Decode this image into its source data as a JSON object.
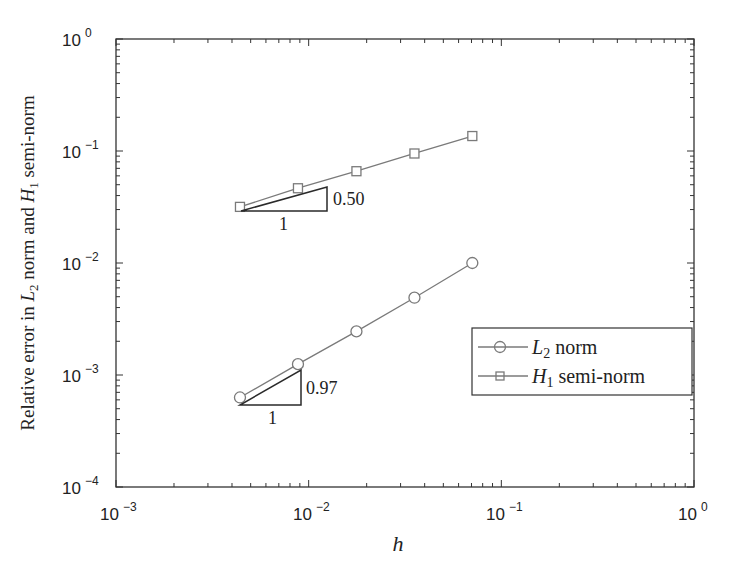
{
  "chart_data": {
    "type": "line",
    "title": "",
    "xlabel": "h",
    "ylabel": "Relative error in L2 norm and H1 semi-norm",
    "xscale": "log",
    "yscale": "log",
    "xlim": [
      0.001,
      1
    ],
    "ylim": [
      0.0001,
      1
    ],
    "x_ticks": [
      "10^-3",
      "10^-2",
      "10^-1",
      "10^0"
    ],
    "y_ticks": [
      "10^-4",
      "10^-3",
      "10^-2",
      "10^-1",
      "10^0"
    ],
    "grid": false,
    "legend_position": "right-center",
    "x": [
      0.0044,
      0.0088,
      0.0177,
      0.0354,
      0.0707
    ],
    "series": [
      {
        "name": "L2 norm",
        "marker": "circle",
        "values": [
          0.00063,
          0.00125,
          0.00245,
          0.0049,
          0.01
        ]
      },
      {
        "name": "H1 semi-norm",
        "marker": "square",
        "values": [
          0.0317,
          0.0465,
          0.066,
          0.095,
          0.136
        ]
      }
    ],
    "annotations": [
      {
        "type": "slope-triangle",
        "series": "H1 semi-norm",
        "run_label": "1",
        "rise_label": "0.50"
      },
      {
        "type": "slope-triangle",
        "series": "L2 norm",
        "run_label": "1",
        "rise_label": "0.97"
      }
    ]
  },
  "axes": {
    "xlabel": "h",
    "ylabel_parts": {
      "pre": "Relative error in ",
      "L": "L",
      "L_sub": "2",
      "mid": " norm and ",
      "H": "H",
      "H_sub": "1",
      "post": " semi-norm"
    },
    "x_ticks": [
      {
        "base": "10",
        "exp": "−3"
      },
      {
        "base": "10",
        "exp": "−2"
      },
      {
        "base": "10",
        "exp": "−1"
      },
      {
        "base": "10",
        "exp": "0"
      }
    ],
    "y_ticks": [
      {
        "base": "10",
        "exp": "0"
      },
      {
        "base": "10",
        "exp": "−1"
      },
      {
        "base": "10",
        "exp": "−2"
      },
      {
        "base": "10",
        "exp": "−3"
      },
      {
        "base": "10",
        "exp": "−4"
      }
    ]
  },
  "legend": {
    "items": [
      {
        "sym": "L",
        "sub": "2",
        "text": " norm"
      },
      {
        "sym": "H",
        "sub": "1",
        "text": " semi-norm"
      }
    ]
  },
  "slopes": {
    "h1": {
      "run": "1",
      "rise": "0.50"
    },
    "l2": {
      "run": "1",
      "rise": "0.97"
    }
  },
  "colors": {
    "line": "#7a7a7a",
    "axis": "#333333",
    "triangle": "#2a2a2a"
  }
}
